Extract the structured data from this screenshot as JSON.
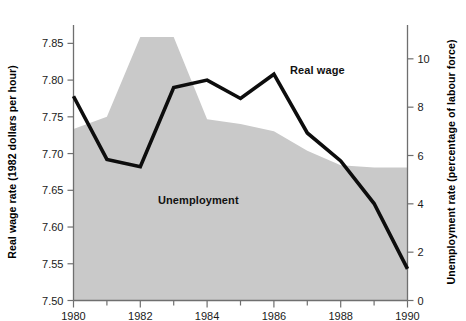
{
  "chart_data": {
    "type": "line",
    "title": "",
    "xlabel": "",
    "ylabel": "Real wage rate (1982 dollars per hour)",
    "y2label": "Unemployment rate (percentage of labour force)",
    "x": [
      1980,
      1981,
      1982,
      1983,
      1984,
      1985,
      1986,
      1987,
      1988,
      1989,
      1990
    ],
    "xlim": [
      1980,
      1990
    ],
    "ylim": [
      7.5,
      7.875
    ],
    "y2lim": [
      0,
      11.4
    ],
    "xticks": [
      1980,
      1981,
      1982,
      1983,
      1984,
      1985,
      1986,
      1987,
      1988,
      1989,
      1990
    ],
    "xticklabels": [
      "1980",
      "",
      "1982",
      "",
      "1984",
      "",
      "1986",
      "",
      "1988",
      "",
      "1990"
    ],
    "yticks": [
      7.5,
      7.55,
      7.6,
      7.65,
      7.7,
      7.75,
      7.8,
      7.85
    ],
    "yticklabels": [
      "7.50",
      "7.55",
      "7.60",
      "7.65",
      "7.70",
      "7.75",
      "7.80",
      "7.85"
    ],
    "y2ticks": [
      0,
      2,
      4,
      6,
      8,
      10
    ],
    "y2ticklabels": [
      "0",
      "2",
      "4",
      "6",
      "8",
      "10"
    ],
    "grid": false,
    "legend_position": "inline-annotation",
    "series": [
      {
        "name": "Real wage",
        "render": "line",
        "axis": "left",
        "color": "#0d0d0d",
        "values": [
          7.778,
          7.692,
          7.682,
          7.79,
          7.8,
          7.775,
          7.808,
          7.728,
          7.69,
          7.632,
          7.543
        ]
      },
      {
        "name": "Unemployment",
        "render": "area",
        "axis": "right",
        "color": "#c9c9c9",
        "values": [
          7.1,
          7.6,
          10.9,
          10.9,
          7.5,
          7.3,
          7.0,
          6.2,
          5.6,
          5.5,
          5.5
        ]
      }
    ],
    "annotations": [
      {
        "text": "Real wage",
        "x": 1986.7,
        "y": 7.8
      },
      {
        "text": "Unemployment",
        "x": 1984.3,
        "y": 7.635
      }
    ]
  },
  "axes": {
    "left_title": "Real wage rate (1982 dollars per hour)",
    "right_title": "Unemployment rate (percentage of labour force)"
  },
  "labels": {
    "real_wage": "Real wage",
    "unemployment": "Unemployment"
  }
}
